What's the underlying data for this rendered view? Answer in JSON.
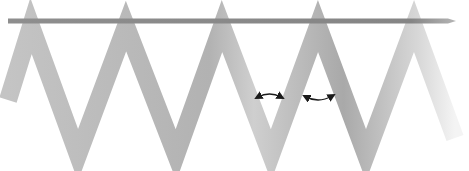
{
  "figure": {
    "colors": {
      "background": "#ffffff",
      "bar": "#8a8a8a",
      "ribbon_dark": "#a8a8a8",
      "ribbon_light": "#d0d0d0",
      "arrow": "#1a1a1a"
    },
    "bar": {
      "x1": 8,
      "x2": 456,
      "y": 21,
      "thickness": 5
    },
    "ribbon": {
      "width": 18,
      "points": [
        [
          8,
          100
        ],
        [
          31,
          26
        ],
        [
          78,
          155
        ],
        [
          126,
          26
        ],
        [
          176,
          155
        ],
        [
          222,
          26
        ],
        [
          271,
          155
        ],
        [
          318,
          26
        ],
        [
          366,
          155
        ],
        [
          414,
          26
        ],
        [
          455,
          138
        ]
      ]
    },
    "arrows": [
      {
        "name": "rotate-arrow-left",
        "x1": 258,
        "y1": 97,
        "x2": 281,
        "y2": 97,
        "bulge": -6
      },
      {
        "name": "rotate-arrow-right",
        "x1": 306,
        "y1": 97,
        "x2": 332,
        "y2": 96,
        "bulge": 7
      }
    ]
  }
}
